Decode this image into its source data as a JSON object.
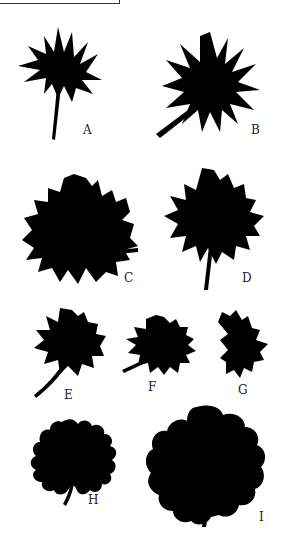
{
  "figure": {
    "ink_color": "#000000",
    "background": "#ffffff",
    "specimens": [
      {
        "label": "A"
      },
      {
        "label": "B"
      },
      {
        "label": "C"
      },
      {
        "label": "D"
      },
      {
        "label": "E"
      },
      {
        "label": "F"
      },
      {
        "label": "G"
      },
      {
        "label": "H"
      },
      {
        "label": "I"
      }
    ]
  }
}
